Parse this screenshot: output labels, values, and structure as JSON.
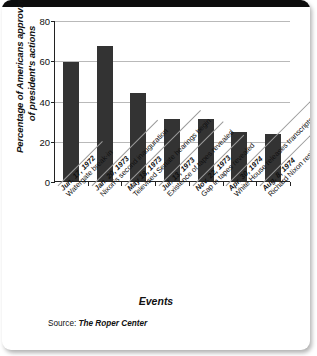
{
  "figure": {
    "y_axis_title": "Percentage of Americans approving of president's actions",
    "x_axis_title": "Events",
    "source_label": "Source:",
    "source_name": "The Roper Center"
  },
  "chart_data": {
    "type": "bar",
    "title": "",
    "xlabel": "Events",
    "ylabel": "Percentage of Americans approving of president's actions",
    "ylim": [
      0,
      80
    ],
    "yticks": [
      0,
      20,
      40,
      60,
      80
    ],
    "grid": true,
    "legend": "none",
    "bar_color": "#333333",
    "categories": [
      "Jun. 17, 1972 Watergate break-in",
      "Jan. 20, 1973 Nixon's second inauguration",
      "May 18, 1973 Televised Senate hearings begin",
      "Jul. 13, 1973 Existence of tapes revealed",
      "Nov. 22, 1973 Gap in tapes revealed",
      "Apr. 30, 1974 White House releases transcripts of tapes",
      "Aug. 8, 1974 Richard Nixon resigns presidency"
    ],
    "category_parts": [
      {
        "date": "Jun. 17, 1972",
        "desc": "Watergate break-in"
      },
      {
        "date": "Jan. 20, 1973",
        "desc": "Nixon's second inauguration"
      },
      {
        "date": "May 18, 1973",
        "desc": "Televised Senate hearings begin"
      },
      {
        "date": "Jul. 13, 1973",
        "desc": "Existence of tapes revealed"
      },
      {
        "date": "Nov. 22, 1973",
        "desc": "Gap in tapes revealed"
      },
      {
        "date": "Apr. 30, 1974",
        "desc": "White House releases transcripts of tapes"
      },
      {
        "date": "Aug. 8, 1974",
        "desc": "Richard Nixon resigns presidency"
      }
    ],
    "values": [
      59,
      67,
      43.5,
      31,
      31,
      24.5,
      23.5
    ]
  }
}
